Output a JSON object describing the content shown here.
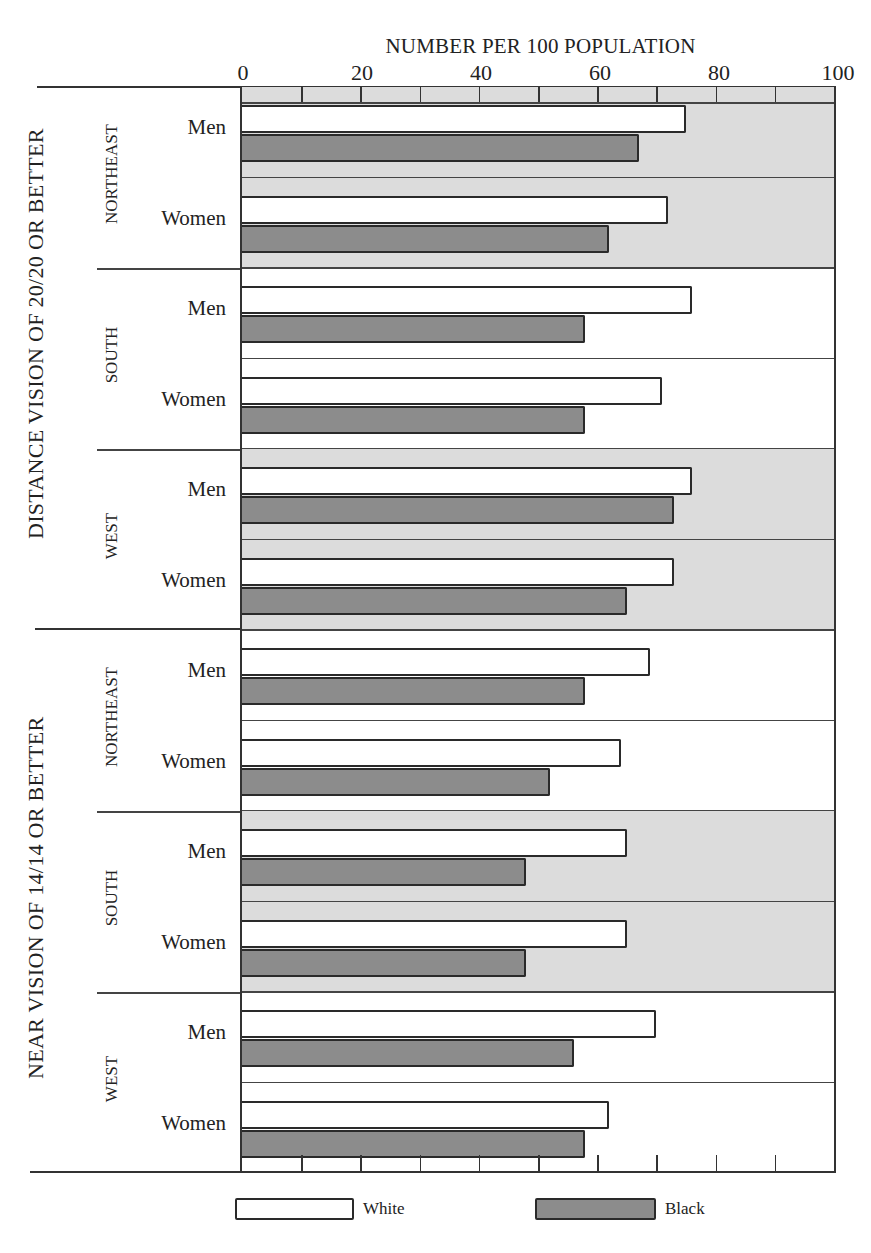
{
  "chart_data": {
    "type": "bar",
    "orientation": "horizontal",
    "title": "NUMBER PER 100 POPULATION",
    "xlabel": "NUMBER PER 100 POPULATION",
    "xlim": [
      0,
      100
    ],
    "x_ticks": [
      "0",
      "20",
      "40",
      "60",
      "80",
      "100"
    ],
    "legend": [
      {
        "name": "White",
        "color": "#ffffff"
      },
      {
        "name": "Black",
        "color": "#8c8c8c"
      }
    ],
    "legend_position": "bottom",
    "sections": [
      {
        "label": "DISTANCE VISION OF 20/20 OR BETTER",
        "regions": [
          {
            "label": "NORTHEAST",
            "shaded": true,
            "groups": [
              {
                "label": "Men",
                "White": 75,
                "Black": 67
              },
              {
                "label": "Women",
                "White": 72,
                "Black": 62
              }
            ]
          },
          {
            "label": "SOUTH",
            "shaded": false,
            "groups": [
              {
                "label": "Men",
                "White": 76,
                "Black": 58
              },
              {
                "label": "Women",
                "White": 71,
                "Black": 58
              }
            ]
          },
          {
            "label": "WEST",
            "shaded": true,
            "groups": [
              {
                "label": "Men",
                "White": 76,
                "Black": 73
              },
              {
                "label": "Women",
                "White": 73,
                "Black": 65
              }
            ]
          }
        ]
      },
      {
        "label": "NEAR VISION OF 14/14 OR BETTER",
        "regions": [
          {
            "label": "NORTHEAST",
            "shaded": false,
            "groups": [
              {
                "label": "Men",
                "White": 69,
                "Black": 58
              },
              {
                "label": "Women",
                "White": 64,
                "Black": 52
              }
            ]
          },
          {
            "label": "SOUTH",
            "shaded": true,
            "groups": [
              {
                "label": "Men",
                "White": 65,
                "Black": 48
              },
              {
                "label": "Women",
                "White": 65,
                "Black": 48
              }
            ]
          },
          {
            "label": "WEST",
            "shaded": false,
            "groups": [
              {
                "label": "Men",
                "White": 70,
                "Black": 56
              },
              {
                "label": "Women",
                "White": 62,
                "Black": 58
              }
            ]
          }
        ]
      }
    ],
    "categories": [
      "Distance NE Men",
      "Distance NE Women",
      "Distance South Men",
      "Distance South Women",
      "Distance West Men",
      "Distance West Women",
      "Near NE Men",
      "Near NE Women",
      "Near South Men",
      "Near South Women",
      "Near West Men",
      "Near West Women"
    ],
    "series": [
      {
        "name": "White",
        "values": [
          75,
          72,
          76,
          71,
          76,
          73,
          69,
          64,
          65,
          65,
          70,
          62
        ]
      },
      {
        "name": "Black",
        "values": [
          67,
          62,
          58,
          58,
          73,
          65,
          58,
          52,
          48,
          48,
          56,
          58
        ]
      }
    ],
    "grid": false
  },
  "labels": {
    "axis_title": "NUMBER PER 100 POPULATION",
    "ticks": [
      "0",
      "20",
      "40",
      "60",
      "80",
      "100"
    ],
    "section_distance": "DISTANCE VISION OF 20/20 OR BETTER",
    "section_near": "NEAR VISION OF 14/14 OR BETTER",
    "region_northeast": "NORTHEAST",
    "region_south": "SOUTH",
    "region_west": "WEST",
    "men": "Men",
    "women": "Women",
    "legend_white": "White",
    "legend_black": "Black"
  }
}
